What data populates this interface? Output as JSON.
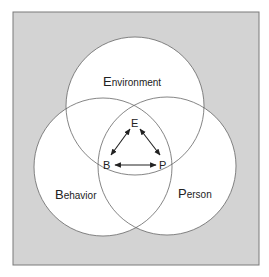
{
  "diagram": {
    "type": "venn-triadic-reciprocal",
    "colors": {
      "background": "#d3d3d3",
      "frame_border": "#7a7a7a",
      "circle_fill": "#ffffff",
      "circle_stroke": "#666666",
      "text": "#222222",
      "arrow": "#222222"
    },
    "circles": [
      {
        "id": "environment",
        "initial": "E",
        "rest": "nvironment"
      },
      {
        "id": "behavior",
        "initial": "B",
        "rest": "ehavior"
      },
      {
        "id": "person",
        "initial": "P",
        "rest": "erson"
      }
    ],
    "center_nodes": {
      "e": "E",
      "b": "B",
      "p": "P"
    },
    "arrows": [
      {
        "from": "E",
        "to": "B",
        "bidirectional": true
      },
      {
        "from": "E",
        "to": "P",
        "bidirectional": true
      },
      {
        "from": "B",
        "to": "P",
        "bidirectional": true
      }
    ]
  }
}
